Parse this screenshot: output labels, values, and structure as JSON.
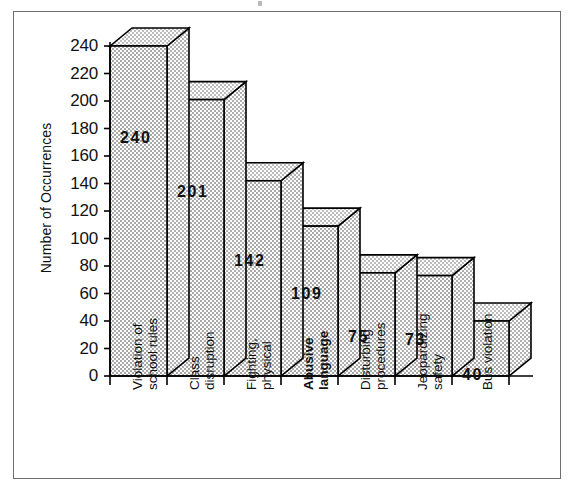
{
  "figure": {
    "border_color": "#6f6f6f",
    "background": "#ffffff",
    "bar_fill": "#c9c9c9",
    "bar_outline": "#000000"
  },
  "chart_data": {
    "type": "bar",
    "title": "",
    "subtitle": "",
    "xlabel": "",
    "ylabel": "Number of Occurrences",
    "ylim": [
      0,
      240
    ],
    "ytick_step": 20,
    "grid": false,
    "legend": "none",
    "style": "3d-isometric",
    "categories": [
      "Violation of school rules",
      "Class disruption",
      "Fighting, physical",
      "Abusive language",
      "Disturbing procedures",
      "Jeopardizing safety",
      "Bus violation"
    ],
    "category_lines": [
      [
        "Violation of",
        "school rules"
      ],
      [
        "Class",
        "disruption"
      ],
      [
        "Fighting,",
        "physical"
      ],
      [
        "Abusive",
        "language"
      ],
      [
        "Disturbing",
        "procedures"
      ],
      [
        "Jeopardizing",
        "safety"
      ],
      [
        "Bus violation"
      ]
    ],
    "values": [
      240,
      201,
      142,
      109,
      75,
      73,
      40
    ],
    "value_labels": [
      "240",
      "201",
      "142",
      "109",
      "75",
      "73",
      "40"
    ],
    "yticks": [
      0,
      20,
      40,
      60,
      80,
      100,
      120,
      140,
      160,
      180,
      200,
      220,
      240
    ],
    "ytick_labels": [
      "0",
      "20",
      "40",
      "60",
      "80",
      "100",
      "120",
      "140",
      "160",
      "180",
      "200",
      "220",
      "240"
    ],
    "emphasis": {
      "bold_category_index": 3
    }
  }
}
